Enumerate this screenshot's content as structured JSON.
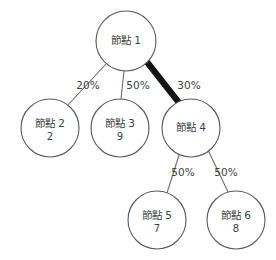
{
  "diagram": {
    "title": "",
    "background_color": "#ffffff",
    "node_stroke_color": "#555a5e",
    "node_fill_color": "#ffffff",
    "edge_color": "#6a6f73",
    "highlight_edge_color": "#141414",
    "text_color": "#3a3f43",
    "nodes": [
      {
        "id": "n1",
        "label": "節點 1",
        "value": "",
        "cx": 126,
        "cy": 41,
        "r": 30
      },
      {
        "id": "n2",
        "label": "節點 2",
        "value": "2",
        "cx": 50,
        "cy": 128,
        "r": 29
      },
      {
        "id": "n3",
        "label": "節點 3",
        "value": "9",
        "cx": 120,
        "cy": 128,
        "r": 29
      },
      {
        "id": "n4",
        "label": "節點 4",
        "value": "",
        "cx": 191,
        "cy": 128,
        "r": 29
      },
      {
        "id": "n5",
        "label": "節點 5",
        "value": "7",
        "cx": 157,
        "cy": 220,
        "r": 29
      },
      {
        "id": "n6",
        "label": "節點 6",
        "value": "8",
        "cx": 236,
        "cy": 220,
        "r": 29
      }
    ],
    "edges": [
      {
        "id": "e1",
        "from": "n1",
        "to": "n2",
        "label": "20%",
        "highlight": false,
        "x1": 106,
        "y1": 64,
        "x2": 68,
        "y2": 105,
        "lx": 88,
        "ly": 86
      },
      {
        "id": "e2",
        "from": "n1",
        "to": "n3",
        "label": "50%",
        "highlight": false,
        "x1": 124,
        "y1": 71,
        "x2": 121,
        "y2": 99,
        "lx": 138,
        "ly": 86
      },
      {
        "id": "e3",
        "from": "n1",
        "to": "n4",
        "label": "30%",
        "highlight": true,
        "x1": 147,
        "y1": 62,
        "x2": 180,
        "y2": 104,
        "lx": 189,
        "ly": 86
      },
      {
        "id": "e4",
        "from": "n4",
        "to": "n5",
        "label": "50%",
        "highlight": false,
        "x1": 180,
        "y1": 152,
        "x2": 167,
        "y2": 193,
        "lx": 183,
        "ly": 173
      },
      {
        "id": "e5",
        "from": "n4",
        "to": "n6",
        "label": "50%",
        "highlight": false,
        "x1": 208,
        "y1": 150,
        "x2": 228,
        "y2": 192,
        "lx": 226,
        "ly": 173
      }
    ]
  }
}
